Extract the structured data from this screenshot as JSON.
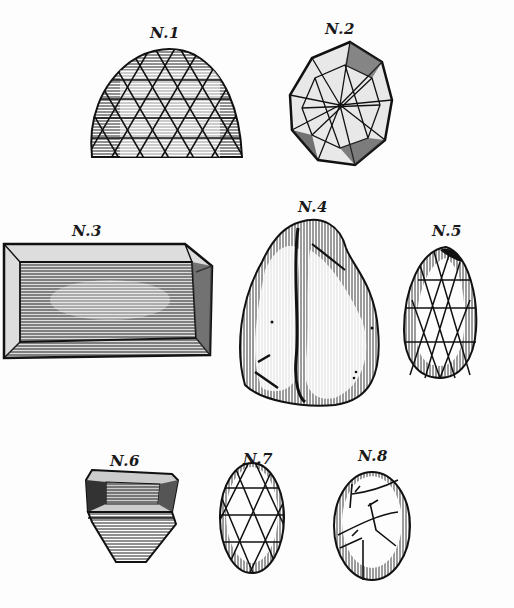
{
  "plate": {
    "background": "#fdfdfd",
    "ink": "#111111",
    "figures": [
      {
        "id": 1,
        "label": "N.1",
        "shape": "rose-cut dome, triangular facets"
      },
      {
        "id": 2,
        "label": "N.2",
        "shape": "polygonal brilliant, star facets"
      },
      {
        "id": 3,
        "label": "N.3",
        "shape": "rectangular table-cut slab"
      },
      {
        "id": 4,
        "label": "N.4",
        "shape": "rough uncut stone"
      },
      {
        "id": 5,
        "label": "N.5",
        "shape": "pear-shaped rose cut"
      },
      {
        "id": 6,
        "label": "N.6",
        "shape": "step-cut stone, side view"
      },
      {
        "id": 7,
        "label": "N.7",
        "shape": "oval rose cut"
      },
      {
        "id": 8,
        "label": "N.8",
        "shape": "oval cabochon with fractures"
      }
    ]
  }
}
